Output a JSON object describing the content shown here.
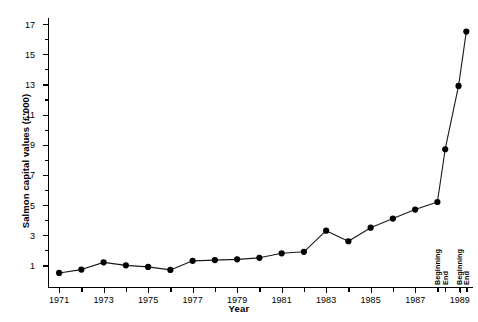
{
  "chart_data": {
    "type": "line",
    "title": "",
    "xlabel": "Year",
    "ylabel": "Salmon capital values (£'000)",
    "xlim": [
      1970.5,
      1989.6
    ],
    "ylim": [
      -0.5,
      17.4
    ],
    "grid": false,
    "legend": null,
    "y_ticks": [
      1,
      3,
      5,
      7,
      9,
      11,
      13,
      15,
      17
    ],
    "y_minor_ticks": [
      2,
      4,
      6,
      8,
      10,
      12,
      14,
      16
    ],
    "y_tick_labels": [
      "1",
      "3",
      "5",
      "7",
      "9",
      "11",
      "13",
      "15",
      "17"
    ],
    "x_ticks": [
      1971,
      1973,
      1975,
      1977,
      1979,
      1981,
      1983,
      1985,
      1987,
      1989
    ],
    "x_tick_labels": [
      "1971",
      "1973",
      "1975",
      "1977",
      "1979",
      "1981",
      "1983",
      "1985",
      "1987",
      "1989"
    ],
    "x_minor_ticks": [
      1972,
      1974,
      1976,
      1978,
      1980,
      1982,
      1984,
      1986,
      1988
    ],
    "x": [
      1971,
      1972,
      1973,
      1974,
      1975,
      1976,
      1977,
      1978,
      1979,
      1980,
      1981,
      1982,
      1983,
      1984,
      1985,
      1986,
      1987,
      1988.0,
      1988.35,
      1988.95,
      1989.3
    ],
    "values": [
      0.5,
      0.72,
      1.2,
      1.0,
      0.9,
      0.7,
      1.3,
      1.35,
      1.4,
      1.5,
      1.8,
      1.9,
      3.3,
      2.6,
      3.5,
      4.1,
      4.7,
      5.2,
      8.7,
      12.9,
      16.5
    ],
    "point_labels": [
      "1971",
      "1972",
      "1973",
      "1974",
      "1975",
      "1976",
      "1977",
      "1978",
      "1979",
      "1980",
      "1981",
      "1982",
      "1983",
      "1984",
      "1985",
      "1986",
      "1987",
      "1988 Beginning",
      "1988 End",
      "1989 Beginning",
      "1989 End"
    ],
    "annotations": [
      {
        "text": "Beginning",
        "x": 1988.0
      },
      {
        "text": "End",
        "x": 1988.35
      },
      {
        "text": "Beginning",
        "x": 1988.95
      },
      {
        "text": "End",
        "x": 1989.3
      }
    ],
    "colors": {
      "line": "#1a1a1a",
      "marker": "#000000",
      "axis": "#000000",
      "background": "#ffffff"
    }
  }
}
